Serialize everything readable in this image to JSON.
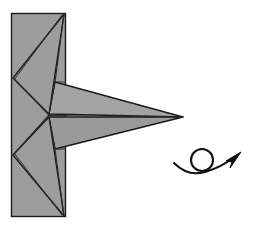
{
  "figure": {
    "background_color": "#ffffff",
    "paper_fill": "#9d9d9d",
    "paper_fill_light": "#a8a8a8",
    "paper_fill_dark": "#929292",
    "outline_color": "#1a1a1a",
    "crease_color": "#2b2b2b",
    "arrow_color": "#111111"
  },
  "shapes": {
    "backing_rectangle": {
      "name": "vertical-rectangle-panel",
      "x": 11,
      "y": 13,
      "width": 55,
      "height": 204,
      "fill": "#9d9d9d"
    },
    "star_point_tip": {
      "x": 183,
      "y": 117
    },
    "star_center": {
      "x": 49,
      "y": 115
    },
    "left_upper_vertex": {
      "x": 13,
      "y": 78
    },
    "left_lower_vertex": {
      "x": 13,
      "y": 155
    },
    "top_right_vertex": {
      "x": 64,
      "y": 14
    },
    "bottom_right_vertex": {
      "x": 64,
      "y": 216
    }
  },
  "annotations": {
    "turn_over_symbol": {
      "name": "turn-over-arrow",
      "circle_center_x": 202,
      "circle_center_y": 160,
      "circle_radius": 11,
      "arrow_start_x": 175,
      "arrow_start_y": 164,
      "arrow_end_x": 240,
      "arrow_end_y": 154,
      "meaning": "turn the model over"
    }
  },
  "labels": {
    "caption": ""
  }
}
